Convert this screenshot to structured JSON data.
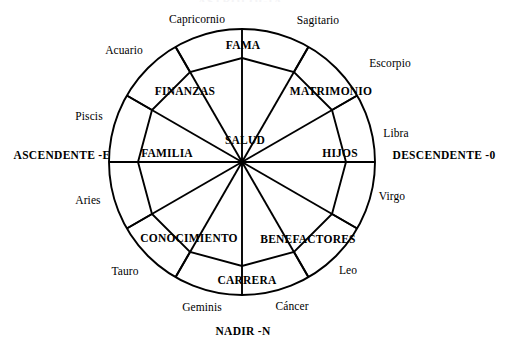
{
  "figure": {
    "title_remnant": "ASTROLOGIA",
    "type": "astrological-house-wheel",
    "stroke_color": "#000000",
    "background_color": "#ffffff"
  },
  "geometry": {
    "center_x": 242,
    "center_y": 162,
    "outer_radius": 133,
    "inner_radius": 104,
    "spoke_count": 12
  },
  "axes": [
    {
      "name": "ascendente",
      "label": "ASCENDENTE -E",
      "position": "left",
      "x": 62,
      "y": 156
    },
    {
      "name": "descendente",
      "label": "DESCENDENTE -0",
      "position": "right",
      "x": 444,
      "y": 156
    },
    {
      "name": "nadir",
      "label": "NADIR -N",
      "position": "bottom",
      "x": 243,
      "y": 332
    }
  ],
  "zodiac": [
    {
      "name": "capricornio",
      "label": "Capricornio",
      "x": 197,
      "y": 20
    },
    {
      "name": "sagitario",
      "label": "Sagitario",
      "x": 318,
      "y": 21
    },
    {
      "name": "escorpio",
      "label": "Escorpio",
      "x": 390,
      "y": 64
    },
    {
      "name": "libra",
      "label": "Libra",
      "x": 396,
      "y": 134
    },
    {
      "name": "virgo",
      "label": "Virgo",
      "x": 392,
      "y": 197
    },
    {
      "name": "leo",
      "label": "Leo",
      "x": 348,
      "y": 271
    },
    {
      "name": "cancer",
      "label": "Cáncer",
      "x": 292,
      "y": 307
    },
    {
      "name": "geminis",
      "label": "Geminis",
      "x": 202,
      "y": 308
    },
    {
      "name": "tauro",
      "label": "Tauro",
      "x": 125,
      "y": 272
    },
    {
      "name": "aries",
      "label": "Aries",
      "x": 88,
      "y": 201
    },
    {
      "name": "piscis",
      "label": "Piscis",
      "x": 89,
      "y": 117
    },
    {
      "name": "acuario",
      "label": "Acuario",
      "x": 124,
      "y": 51
    }
  ],
  "houses": [
    {
      "name": "fama",
      "label": "FAMA",
      "x": 243,
      "y": 46
    },
    {
      "name": "matrimonio",
      "label": "MATRIMONIO",
      "x": 331,
      "y": 92
    },
    {
      "name": "hijos",
      "label": "HIJOS",
      "x": 340,
      "y": 154
    },
    {
      "name": "benefactores",
      "label": "BENEFACTORES",
      "x": 308,
      "y": 240
    },
    {
      "name": "carrera",
      "label": "CARRERA",
      "x": 247,
      "y": 281
    },
    {
      "name": "conocimiento",
      "label": "CONOCIMIENTO",
      "x": 189,
      "y": 239
    },
    {
      "name": "familia",
      "label": "FAMILIA",
      "x": 167,
      "y": 154
    },
    {
      "name": "finanzas",
      "label": "FINANZAS",
      "x": 185,
      "y": 92
    },
    {
      "name": "salud",
      "label": "SALUD",
      "x": 245,
      "y": 141
    }
  ]
}
